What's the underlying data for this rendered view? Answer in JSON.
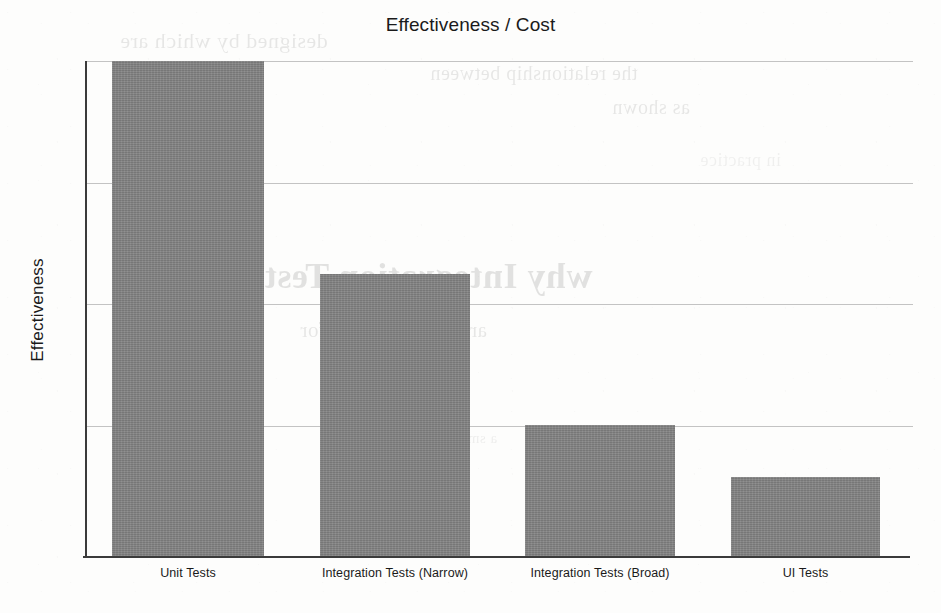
{
  "chart_data": {
    "type": "bar",
    "title": "Effectiveness / Cost",
    "xlabel": "",
    "ylabel": "Effectiveness",
    "categories": [
      "Unit Tests",
      "Integration Tests (Narrow)",
      "Integration Tests (Broad)",
      "UI Tests"
    ],
    "values": [
      100,
      57,
      26.5,
      16
    ],
    "ylim": [
      0,
      100
    ],
    "grid": true,
    "gridline_values": [
      100,
      75.4,
      50.9,
      26.3
    ],
    "y_tick_labels": [],
    "legend": null,
    "bar_color": "#828282",
    "axis_color": "#3b3b3b",
    "gridline_color": "#b9b9b9",
    "background_color": "#fdfdfc"
  },
  "page": {
    "ghost_text": {
      "line_a": "designed by which are",
      "line_b": "the relationship between",
      "line_c": "as shown",
      "line_d": "why Integration Tests",
      "line_e": "are the best value for",
      "line_f": "a small number of",
      "line_g": "in practice"
    }
  }
}
